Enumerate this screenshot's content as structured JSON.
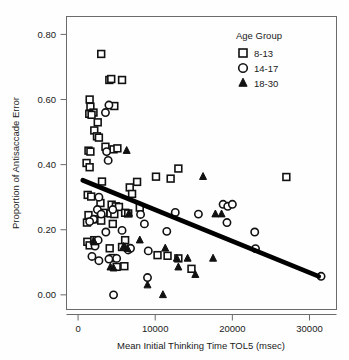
{
  "chart_data": {
    "type": "scatter",
    "title": "",
    "xlabel": "Mean Initial Thinking Time TOL5 (msec)",
    "ylabel": "Proportion of Antisaccade Error",
    "xlim": [
      -1500,
      33500
    ],
    "ylim": [
      -0.045,
      0.855
    ],
    "xticks": [
      0,
      10000,
      20000,
      30000
    ],
    "xtick_labels": [
      "0",
      "10000",
      "20000",
      "30000"
    ],
    "yticks": [
      0.0,
      0.2,
      0.4,
      0.6,
      0.8
    ],
    "ytick_labels": [
      "0.00",
      "0.20",
      "0.40",
      "0.60",
      "0.80"
    ],
    "grid": false,
    "legend": {
      "title": "Age Group",
      "position": "top-right",
      "entries": [
        {
          "label": "8-13",
          "marker": "open-square",
          "color": "#111111"
        },
        {
          "label": "14-17",
          "marker": "open-circle",
          "color": "#111111"
        },
        {
          "label": "18-30",
          "marker": "filled-triangle",
          "color": "#111111"
        }
      ]
    },
    "trendline": {
      "type": "linear-fit",
      "x": [
        600,
        31200
      ],
      "y": [
        0.352,
        0.057
      ],
      "color": "#000000"
    },
    "series": [
      {
        "name": "8-13",
        "marker": "open-square",
        "points": [
          [
            3000,
            0.74
          ],
          [
            4050,
            0.66
          ],
          [
            4300,
            0.663
          ],
          [
            5700,
            0.66
          ],
          [
            1500,
            0.6
          ],
          [
            1600,
            0.578
          ],
          [
            2000,
            0.56
          ],
          [
            1450,
            0.556
          ],
          [
            1750,
            0.553
          ],
          [
            4700,
            0.58
          ],
          [
            2550,
            0.53
          ],
          [
            2100,
            0.505
          ],
          [
            2450,
            0.487
          ],
          [
            2700,
            0.483
          ],
          [
            1350,
            0.443
          ],
          [
            1600,
            0.44
          ],
          [
            3550,
            0.455
          ],
          [
            4600,
            0.447
          ],
          [
            5100,
            0.45
          ],
          [
            1100,
            0.405
          ],
          [
            1500,
            0.392
          ],
          [
            3100,
            0.348
          ],
          [
            7650,
            0.347
          ],
          [
            10100,
            0.363
          ],
          [
            12000,
            0.357
          ],
          [
            13000,
            0.388
          ],
          [
            27000,
            0.362
          ],
          [
            6700,
            0.33
          ],
          [
            7000,
            0.31
          ],
          [
            1250,
            0.307
          ],
          [
            1700,
            0.302
          ],
          [
            2900,
            0.282
          ],
          [
            4350,
            0.277
          ],
          [
            4900,
            0.272
          ],
          [
            5300,
            0.27
          ],
          [
            1350,
            0.245
          ],
          [
            2950,
            0.248
          ],
          [
            3300,
            0.252
          ],
          [
            4200,
            0.25
          ],
          [
            4700,
            0.248
          ],
          [
            6100,
            0.252
          ],
          [
            6500,
            0.25
          ],
          [
            8000,
            0.268
          ],
          [
            1150,
            0.222
          ],
          [
            2200,
            0.232
          ],
          [
            3000,
            0.228
          ],
          [
            4500,
            0.218
          ],
          [
            1200,
            0.163
          ],
          [
            1500,
            0.152
          ],
          [
            2100,
            0.168
          ],
          [
            6100,
            0.168
          ],
          [
            11600,
            0.12
          ],
          [
            13000,
            0.112
          ],
          [
            14700,
            0.08
          ],
          [
            4500,
            0.113
          ],
          [
            5000,
            0.086
          ],
          [
            6000,
            0.088
          ],
          [
            10300,
            0.122
          ],
          [
            4100,
            0.143
          ],
          [
            5700,
            0.147
          ]
        ]
      },
      {
        "name": "14-17",
        "marker": "open-circle",
        "points": [
          [
            4000,
            0.583
          ],
          [
            3550,
            0.56
          ],
          [
            3700,
            0.44
          ],
          [
            3900,
            0.413
          ],
          [
            15600,
            0.248
          ],
          [
            18800,
            0.278
          ],
          [
            19400,
            0.272
          ],
          [
            20000,
            0.278
          ],
          [
            19300,
            0.222
          ],
          [
            22900,
            0.193
          ],
          [
            23000,
            0.142
          ],
          [
            31500,
            0.057
          ],
          [
            2700,
            0.3
          ],
          [
            2500,
            0.262
          ],
          [
            3000,
            0.248
          ],
          [
            4500,
            0.262
          ],
          [
            2000,
            0.232
          ],
          [
            1500,
            0.225
          ],
          [
            3600,
            0.193
          ],
          [
            5700,
            0.198
          ],
          [
            8100,
            0.247
          ],
          [
            8600,
            0.218
          ],
          [
            11500,
            0.195
          ],
          [
            2200,
            0.15
          ],
          [
            2600,
            0.168
          ],
          [
            1800,
            0.118
          ],
          [
            2700,
            0.105
          ],
          [
            4000,
            0.11
          ],
          [
            5000,
            0.112
          ],
          [
            6500,
            0.138
          ],
          [
            6800,
            0.143
          ],
          [
            9000,
            0.053
          ],
          [
            4600,
            0.0
          ],
          [
            9100,
            0.135
          ],
          [
            12600,
            0.253
          ]
        ]
      },
      {
        "name": "18-30",
        "marker": "filled-triangle",
        "points": [
          [
            6300,
            0.443
          ],
          [
            16200,
            0.363
          ],
          [
            17800,
            0.248
          ],
          [
            18600,
            0.248
          ],
          [
            8000,
            0.168
          ],
          [
            11300,
            0.143
          ],
          [
            12800,
            0.112
          ],
          [
            14200,
            0.112
          ],
          [
            17500,
            0.112
          ],
          [
            13000,
            0.085
          ],
          [
            15200,
            0.062
          ],
          [
            4200,
            0.085
          ],
          [
            4600,
            0.082
          ],
          [
            5900,
            0.148
          ],
          [
            6400,
            0.142
          ],
          [
            9000,
            0.03
          ],
          [
            11000,
            0.0
          ],
          [
            6600,
            0.25
          ],
          [
            2000,
            0.165
          ],
          [
            2100,
            0.162
          ]
        ]
      }
    ]
  }
}
